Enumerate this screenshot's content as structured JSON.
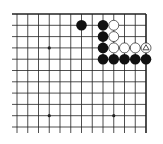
{
  "diagram": {
    "type": "go-board-partial",
    "view": "top-right corner",
    "colors": {
      "background": "#ffffff",
      "line": "#222222",
      "black_stone": "#111111",
      "white_stone_fill": "#ffffff",
      "white_stone_stroke": "#222222"
    },
    "grid": {
      "columns": 13,
      "rows": 11,
      "edges": {
        "top": true,
        "right": true,
        "left": false,
        "bottom": false
      }
    },
    "star_points": [
      {
        "col": 3,
        "row": 3
      },
      {
        "col": 3,
        "row": 9
      },
      {
        "col": 9,
        "row": 9
      }
    ],
    "stones": [
      {
        "color": "black",
        "col": 6,
        "row": 1
      },
      {
        "color": "black",
        "col": 8,
        "row": 1
      },
      {
        "color": "white",
        "col": 9,
        "row": 1
      },
      {
        "color": "black",
        "col": 8,
        "row": 2
      },
      {
        "color": "white",
        "col": 9,
        "row": 2
      },
      {
        "color": "black",
        "col": 8,
        "row": 3
      },
      {
        "color": "white",
        "col": 9,
        "row": 3
      },
      {
        "color": "white",
        "col": 10,
        "row": 3
      },
      {
        "color": "white",
        "col": 11,
        "row": 3
      },
      {
        "color": "white",
        "col": 12,
        "row": 3,
        "marker": "triangle"
      },
      {
        "color": "black",
        "col": 8,
        "row": 4
      },
      {
        "color": "black",
        "col": 9,
        "row": 4
      },
      {
        "color": "black",
        "col": 10,
        "row": 4
      },
      {
        "color": "black",
        "col": 11,
        "row": 4
      },
      {
        "color": "black",
        "col": 12,
        "row": 4
      }
    ]
  }
}
